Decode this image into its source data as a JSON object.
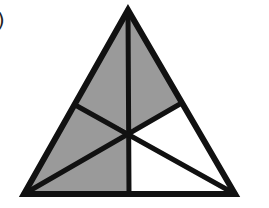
{
  "label": ")",
  "figure": {
    "type": "triangle-divided-by-medians",
    "vertices": {
      "apex": [
        128,
        10
      ],
      "bottom_left": [
        24,
        194
      ],
      "bottom_right": [
        235,
        194
      ]
    },
    "midpoints": {
      "left": [
        77,
        106
      ],
      "right": [
        180,
        104
      ],
      "bottom": [
        129,
        194
      ]
    },
    "centroid": [
      128,
      131
    ],
    "total_regions": 6,
    "shaded_regions": 4,
    "colors": {
      "shaded": "#9a9a9a",
      "unshaded": "#ffffff",
      "stroke": "#111111"
    }
  }
}
